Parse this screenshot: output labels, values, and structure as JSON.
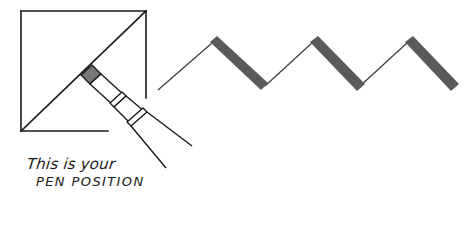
{
  "figure": {
    "caption": {
      "line1": "This is your",
      "line2": "PEN POSITION"
    },
    "colors": {
      "ink": "#1a1a1a",
      "stroke_fill": "#5a5a5a",
      "nib_fill": "#777777",
      "background": "#ffffff"
    },
    "elements": {
      "square": "reference square with diagonal (45° pen angle guide)",
      "pen": "calligraphy pen held at 45° with nib on the diagonal",
      "zigzag": "zigzag stroke showing thin upstrokes and thick downstrokes"
    }
  }
}
